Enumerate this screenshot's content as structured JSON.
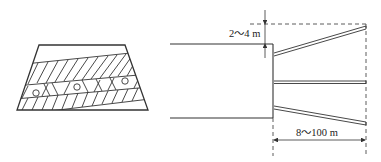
{
  "figure": {
    "left_panel": {
      "title": "Cross-section of slope with anchor row",
      "circles_count": 3
    },
    "right_panel": {
      "title": "Plan view of anchor layout",
      "dimension_vertical": "2～4 m",
      "dimension_horizontal": "8～100 m",
      "anchors_count": 3
    },
    "colors": {
      "line": "#333333",
      "background": "#ffffff"
    }
  }
}
